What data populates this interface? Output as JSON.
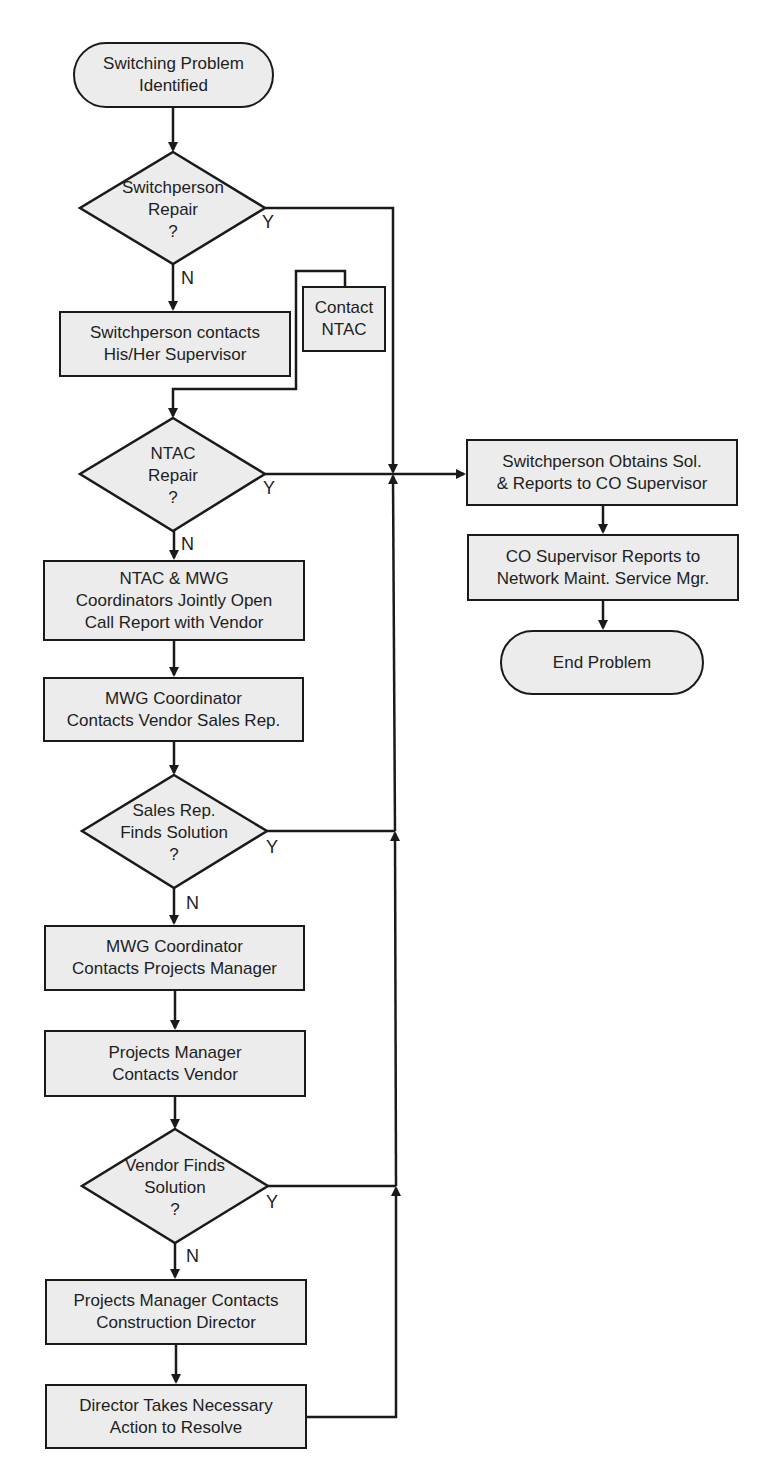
{
  "flowchart": {
    "start": {
      "label_line1": "Switching Problem",
      "label_line2": "Identified"
    },
    "decision_switchperson": {
      "line1": "Switchperson",
      "line2": "Repair",
      "line3": "?",
      "yes_label": "Y",
      "no_label": "N"
    },
    "box_supervisor": {
      "line1": "Switchperson contacts",
      "line2": "His/Her Supervisor"
    },
    "box_contact_ntac": {
      "line1": "Contact",
      "line2": "NTAC"
    },
    "decision_ntac": {
      "line1": "NTAC",
      "line2": "Repair",
      "line3": "?",
      "yes_label": "Y",
      "no_label": "N"
    },
    "box_jointly_open": {
      "line1": "NTAC & MWG",
      "line2": "Coordinators Jointly Open",
      "line3": "Call Report with Vendor"
    },
    "box_sales_rep": {
      "line1": "MWG Coordinator",
      "line2": "Contacts Vendor Sales Rep."
    },
    "decision_sales": {
      "line1": "Sales Rep.",
      "line2": "Finds Solution",
      "line3": "?",
      "yes_label": "Y",
      "no_label": "N"
    },
    "box_projects_mgr": {
      "line1": "MWG Coordinator",
      "line2": "Contacts Projects Manager"
    },
    "box_pm_vendor": {
      "line1": "Projects Manager",
      "line2": "Contacts Vendor"
    },
    "decision_vendor": {
      "line1": "Vendor Finds",
      "line2": "Solution",
      "line3": "?",
      "yes_label": "Y",
      "no_label": "N"
    },
    "box_construction": {
      "line1": "Projects Manager Contacts",
      "line2": "Construction Director"
    },
    "box_director": {
      "line1": "Director Takes Necessary",
      "line2": "Action to Resolve"
    },
    "box_obtains": {
      "line1": "Switchperson Obtains Sol.",
      "line2": "& Reports to CO Supervisor"
    },
    "box_co_supervisor": {
      "line1": "CO Supervisor Reports to",
      "line2": "Network Maint. Service Mgr."
    },
    "end": {
      "label": "End Problem"
    }
  },
  "colors": {
    "fill": "#ececec",
    "stroke": "#1a1a1a",
    "text": "#1e1e1e",
    "background": "#ffffff"
  }
}
